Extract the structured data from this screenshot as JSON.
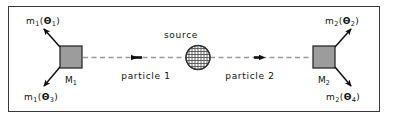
{
  "figure": {
    "name": "epr-particle-measurement-diagram",
    "frame": {
      "border_color": "#3a3a3a",
      "background": "#ffffff"
    },
    "colors": {
      "line": "#111111",
      "dashed_line": "#9a9a9a",
      "detector_fill": "#9c9c9c",
      "detector_stroke": "#2b2b2b",
      "source_hatch": "#555555",
      "text": "#111111"
    },
    "source": {
      "label": "source",
      "icon": "hatched-sphere"
    },
    "particles": [
      {
        "id": "particle-1",
        "label": "particle 1",
        "direction": "left"
      },
      {
        "id": "particle-2",
        "label": "particle 2",
        "direction": "right"
      }
    ],
    "detectors": [
      {
        "id": "detector-m1",
        "label": "M",
        "sub": "1",
        "side": "left"
      },
      {
        "id": "detector-m2",
        "label": "M",
        "sub": "2",
        "side": "right"
      }
    ],
    "outcomes": [
      {
        "id": "outcome-m1-theta1",
        "mass": "m",
        "mass_sub": "1",
        "open": "(",
        "theta": "Θ",
        "theta_sub": "1",
        "close": ")",
        "position": "top-left"
      },
      {
        "id": "outcome-m1-theta3",
        "mass": "m",
        "mass_sub": "1",
        "open": "(",
        "theta": "Θ",
        "theta_sub": "3",
        "close": ")",
        "position": "bottom-left"
      },
      {
        "id": "outcome-m2-theta2",
        "mass": "m",
        "mass_sub": "2",
        "open": "(",
        "theta": "Θ",
        "theta_sub": "2",
        "close": ")",
        "position": "top-right"
      },
      {
        "id": "outcome-m2-theta4",
        "mass": "m",
        "mass_sub": "2",
        "open": "(",
        "theta": "Θ",
        "theta_sub": "4",
        "close": ")",
        "position": "bottom-right"
      }
    ]
  }
}
